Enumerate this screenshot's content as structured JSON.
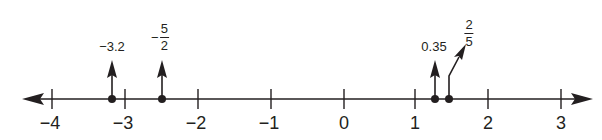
{
  "diagram": {
    "type": "number-line",
    "colors": {
      "ink": "#231f20",
      "background": "#ffffff"
    },
    "axis": {
      "min": -4,
      "max": 3,
      "arrows": "both",
      "y_px": 99,
      "origin_px": 344,
      "unit_px": 73
    },
    "ticks": [
      {
        "value": -4,
        "label": "−4"
      },
      {
        "value": -3,
        "label": "−3"
      },
      {
        "value": -2,
        "label": "−2"
      },
      {
        "value": -1,
        "label": "−1"
      },
      {
        "value": 0,
        "label": "0"
      },
      {
        "value": 1,
        "label": "1"
      },
      {
        "value": 2,
        "label": "2"
      },
      {
        "value": 3,
        "label": "3"
      }
    ],
    "points": [
      {
        "id": "p1",
        "label": "−3.2",
        "kind": "decimal",
        "x_px": 112,
        "arrow": "straight"
      },
      {
        "id": "p2",
        "label": "−5/2",
        "kind": "fraction",
        "sign": "−",
        "numerator": "5",
        "denominator": "2",
        "x_px": 162,
        "arrow": "straight"
      },
      {
        "id": "p3",
        "label": "0.35",
        "kind": "decimal",
        "x_px": 435,
        "arrow": "straight"
      },
      {
        "id": "p4",
        "label": "2/5",
        "kind": "fraction",
        "sign": "",
        "numerator": "2",
        "denominator": "5",
        "x_px": 449,
        "arrow": "bent"
      }
    ]
  }
}
